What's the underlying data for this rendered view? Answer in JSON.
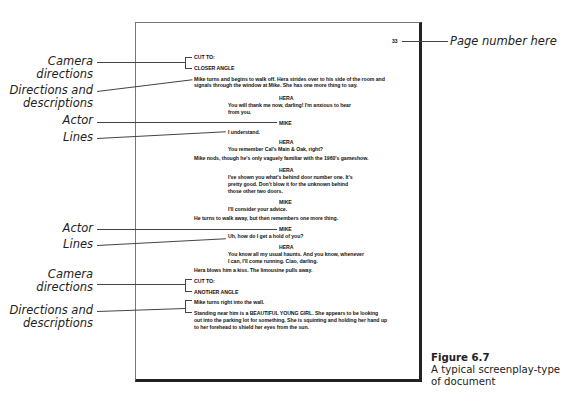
{
  "page_number": "33",
  "annotations": {
    "page_number_label": "Page number here",
    "camera_1": [
      "Camera",
      "directions"
    ],
    "directions_1": [
      "Directions and",
      "descriptions"
    ],
    "actor_1": "Actor",
    "lines_1": "Lines",
    "actor_2": "Actor",
    "lines_2": "Lines",
    "camera_2": [
      "Camera",
      "directions"
    ],
    "directions_2": [
      "Directions and",
      "descriptions"
    ]
  },
  "script": {
    "cut_1": "CUT TO:",
    "angle_1": "CLOSER ANGLE",
    "direction_1": [
      "Mike turns and begins to walk off. Hera strides over to his side of the room and",
      "signals through the window at Mike. She has one more thing to say."
    ],
    "actor_hera_1": "HERA",
    "line_hera_1": [
      "You will thank me now, darling! I'm anxious to hear",
      "from you."
    ],
    "actor_mike_1": "MIKE",
    "line_mike_1": "I understand.",
    "actor_hera_2": "HERA",
    "line_hera_2": "You remember Cal's Main & Oak, right?",
    "direction_2": "Mike nods, though he's only vaguely familiar with the 1960's gameshow.",
    "actor_hera_3": "HERA",
    "line_hera_3": [
      "I've shown you what's behind door number one. It's",
      "pretty good. Don't blow it for the unknown behind",
      "those other two doors."
    ],
    "actor_mike_2": "MIKE",
    "line_mike_2": "I'll consider your advice.",
    "direction_3": "He turns to walk away, but then remembers one more thing.",
    "actor_mike_3": "MIKE",
    "line_mike_3": "Uh, how do I get a hold of you?",
    "actor_hera_4": "HERA",
    "line_hera_4": [
      "You know all my usual haunts. And you know, whenever",
      "I can, I'll come running. Ciao, darling."
    ],
    "direction_4": "Hera blows him a kiss. The limousine pulls away.",
    "cut_2": "CUT TO:",
    "angle_2": "ANOTHER ANGLE",
    "direction_5": "Mike turns right into the wall.",
    "direction_6": [
      "Standing near him is a BEAUTIFUL YOUNG GIRL. She appears to be looking",
      "out into the parking lot for something. She is squinting and holding her hand up",
      "to her forehead to shield her eyes from the sun."
    ]
  },
  "caption": {
    "figure": "Figure 6.7",
    "text": [
      "A typical screenplay-type",
      "of document"
    ]
  }
}
